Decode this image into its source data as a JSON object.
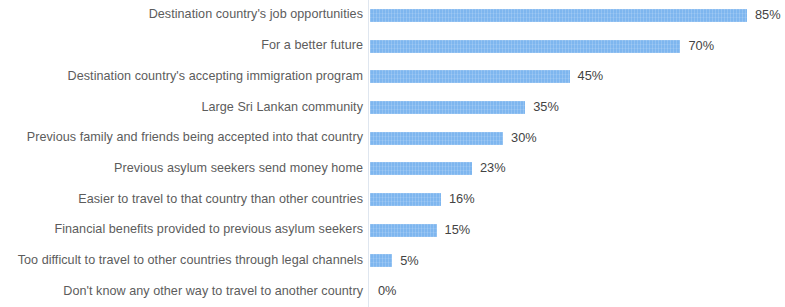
{
  "chart_data": {
    "type": "bar",
    "orientation": "horizontal",
    "title": "",
    "subtitle": "",
    "xlabel": "",
    "ylabel": "",
    "xlim": [
      0,
      85
    ],
    "grid": false,
    "legend": false,
    "value_suffix": "%",
    "categories": [
      "Destination country's job opportunities",
      "For a better future",
      "Destination country's accepting immigration program",
      "Large Sri Lankan community",
      "Previous family and friends being accepted into that country",
      "Previous asylum seekers send money home",
      "Easier to travel to that country than other countries",
      "Financial benefits provided to previous asylum seekers",
      "Too difficult to travel to other countries through legal channels",
      "Don't know any other way to travel to another country"
    ],
    "values": [
      85,
      70,
      45,
      35,
      30,
      23,
      16,
      15,
      5,
      0
    ],
    "data_labels": [
      "85%",
      "70%",
      "45%",
      "35%",
      "30%",
      "23%",
      "16%",
      "15%",
      "5%",
      "0%"
    ],
    "bar_color": "#7eb6ef",
    "label_color": "#5c5c5c",
    "value_color": "#434343",
    "background_color": "#ffffff",
    "axis_line_color": "#dfe6ef"
  }
}
